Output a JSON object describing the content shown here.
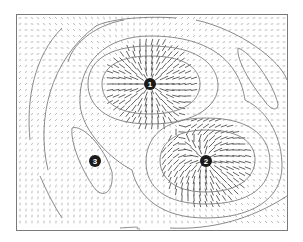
{
  "figure": {
    "frame": {
      "x": 16,
      "y": 14,
      "width": 271,
      "height": 216
    },
    "grid_spacing": 6,
    "colors": {
      "frame": "#7a7a7a",
      "arrow_light": "#8a8a8a",
      "arrow_dark": "#3a3a3a",
      "contour": "#7d7d7d",
      "marker_fill": "#1a1a1a",
      "marker_text": "#ffffff"
    },
    "markers": [
      {
        "id": 1,
        "label": "1",
        "x": 150,
        "y": 84,
        "r": 6,
        "type": "source"
      },
      {
        "id": 2,
        "label": "2",
        "x": 206,
        "y": 161,
        "r": 6,
        "type": "source"
      },
      {
        "id": 3,
        "label": "3",
        "x": 95,
        "y": 161,
        "r": 6,
        "type": "minimum"
      }
    ],
    "contours": [
      {
        "d": "M150,56 C190,56 200,72 200,84 C200,100 185,114 150,114 C115,114 102,100 102,84 C102,70 115,56 150,56 Z"
      },
      {
        "d": "M150,46 C205,46 218,70 218,86 C218,104 198,124 150,124 C104,124 88,104 88,84 C88,64 104,46 150,46 Z"
      },
      {
        "d": "M206,130 C245,130 255,146 255,160 C255,176 240,192 206,192 C172,192 160,176 160,160 C160,146 172,130 206,130 Z"
      },
      {
        "d": "M206,118 C255,118 270,140 270,162 C270,186 250,204 206,204 C166,204 146,188 146,162 C146,140 160,118 206,118 Z"
      },
      {
        "d": "M150,36 C215,36 240,66 245,100 C270,112 282,140 282,166 C282,200 250,218 206,218 C160,218 138,196 132,170 C112,160 82,132 80,104 C78,62 106,36 150,36 Z"
      },
      {
        "d": "M72,128 C82,124 104,146 112,172 C114,192 104,198 96,190 C86,178 70,146 72,128 Z"
      },
      {
        "d": "M238,48 C250,52 272,80 278,104 C278,112 270,110 264,100 C252,86 236,60 238,48 Z"
      },
      {
        "d": "M68,62 C74,40 100,24 124,20"
      },
      {
        "d": "M48,170 C36,120 50,60 96,26 C112,18 150,16 176,18"
      },
      {
        "d": "M196,20 C240,30 280,60 287,80"
      },
      {
        "d": "M30,140 C26,100 34,56 62,28"
      },
      {
        "d": "M62,218 C54,206 46,190 40,176"
      },
      {
        "d": "M170,228 C210,230 250,220 287,196"
      },
      {
        "d": "M120,228 C150,226 130,228 140,229"
      }
    ]
  }
}
